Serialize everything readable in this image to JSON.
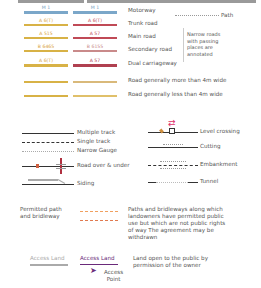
{
  "roads": {
    "rows": [
      {
        "label": "Motorway",
        "left_number": "M 1",
        "right_number": "M 1",
        "left_color": "#7ba7c9",
        "right_color": "#7ba7c9",
        "text_left": "#6d9bbd",
        "text_right": "#6d9bbd"
      },
      {
        "label": "Trunk road",
        "left_number": "A 6(T)",
        "right_number": "A 6(T)",
        "left_color": "#d8b246",
        "right_color": "#c04a56",
        "text_left": "#d8a23a",
        "text_right": "#c04a56"
      },
      {
        "label": "Main road",
        "left_number": "A 515",
        "right_number": "A 57",
        "left_color": "#d8b246",
        "right_color": "#c04a56",
        "text_left": "#d8a23a",
        "text_right": "#c04a56"
      },
      {
        "label": "Secondary road",
        "left_number": "B 6465",
        "right_number": "B 6155",
        "left_color": "#d8b246",
        "right_color": "#c98a8a",
        "text_left": "#d8a23a",
        "text_right": "#c98a8a"
      },
      {
        "label": "Dual carriageway",
        "left_number": "A 6(T)",
        "right_number": "A 57",
        "left_color": "#d8b246",
        "right_color": "#b04050",
        "text_left": "#d8a23a",
        "text_right": "#b04050"
      },
      {
        "label": "Road generally more than 4m wide",
        "left_number": "",
        "right_number": "",
        "left_color": "#d8b246",
        "right_color": "#d9b97a"
      },
      {
        "label": "Road generally less than 4m wide",
        "left_number": "",
        "right_number": "",
        "left_color": "#d8b246",
        "right_color": "#e0c06a"
      }
    ],
    "path_label": "Path",
    "narrow_note": [
      "Narrow roads",
      "with passing",
      "places are",
      "annotated"
    ]
  },
  "railways": {
    "left": [
      "Multiple track",
      "Single track",
      "Narrow Gauge",
      "Road over & under",
      "Siding"
    ],
    "right": [
      "Level crossing",
      "Cutting",
      "Embankment",
      "Tunnel"
    ]
  },
  "permitted": {
    "label": [
      "Permitted path",
      "and bridleway"
    ],
    "description": [
      "Paths and bridleways along which",
      "landowners have permitted public",
      "use but which are not public rights",
      "of way The agreement may be",
      "withdrawn"
    ],
    "colors": {
      "path": "#f0a060",
      "bridleway": "#e07040"
    }
  },
  "access": {
    "grey_label": "Access Land",
    "purple_label": "Access Land",
    "point_label": [
      "Access",
      "Point"
    ],
    "description": [
      "Land open to the public by",
      "permission of the owner"
    ],
    "colors": {
      "grey": "#aaaaaa",
      "purple": "#6a2a7a"
    }
  }
}
